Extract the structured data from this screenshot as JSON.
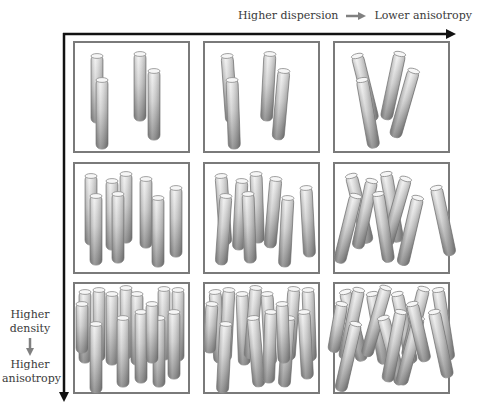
{
  "axes": {
    "horizontal": {
      "from_label": "Higher dispersion",
      "to_label": "Lower anisotropy",
      "arrow_color": "#808080"
    },
    "vertical": {
      "from_label": "Higher density",
      "to_label": "Higher anisotropy",
      "arrow_color": "#808080"
    },
    "axis_color": "#111111"
  },
  "grid": {
    "rows": 3,
    "columns": 3,
    "border_color": "#7a7a7a",
    "rod_gradient": [
      "#f2f2f2",
      "#8a8a8a"
    ],
    "panels": [
      {
        "row": 1,
        "col": 1,
        "rod_count": 4,
        "tilt": "vertical"
      },
      {
        "row": 1,
        "col": 2,
        "rod_count": 4,
        "tilt": "slight"
      },
      {
        "row": 1,
        "col": 3,
        "rod_count": 4,
        "tilt": "strong"
      },
      {
        "row": 2,
        "col": 1,
        "rod_count": 8,
        "tilt": "vertical"
      },
      {
        "row": 2,
        "col": 2,
        "rod_count": 8,
        "tilt": "slight"
      },
      {
        "row": 2,
        "col": 3,
        "rod_count": 8,
        "tilt": "strong"
      },
      {
        "row": 3,
        "col": 1,
        "rod_count": 14,
        "tilt": "vertical"
      },
      {
        "row": 3,
        "col": 2,
        "rod_count": 14,
        "tilt": "slight"
      },
      {
        "row": 3,
        "col": 3,
        "rod_count": 14,
        "tilt": "strong"
      }
    ]
  }
}
